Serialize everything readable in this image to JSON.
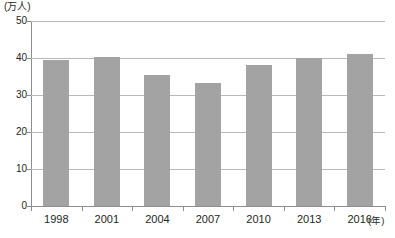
{
  "chart_data": {
    "type": "bar",
    "title": "",
    "subtitle": "",
    "xlabel": "(年)",
    "ylabel": "(万人)",
    "categories": [
      "1998",
      "2001",
      "2004",
      "2007",
      "2010",
      "2013",
      "2016"
    ],
    "values": [
      39.5,
      40.3,
      35.3,
      33.3,
      38.0,
      40.0,
      41.0
    ],
    "series": [
      {
        "name": "人数",
        "values": [
          39.5,
          40.3,
          35.3,
          33.3,
          38.0,
          40.0,
          41.0
        ]
      }
    ],
    "ylim": [
      0,
      50
    ],
    "ytick_labels": [
      "0",
      "10",
      "20",
      "30",
      "40",
      "50"
    ],
    "ytick_values": [
      0,
      10,
      20,
      30,
      40,
      50
    ],
    "xtick_labels": [
      "1998",
      "2001",
      "2004",
      "2007",
      "2010",
      "2013",
      "2016"
    ],
    "grid": true,
    "grid_axis": "y",
    "legend": false,
    "legend_position": "none",
    "bar_color": "#a3a3a3",
    "gridline_color": "#b9b9b9",
    "axis_color": "#8d8d8d",
    "background_color": "#ffffff",
    "annotations": []
  },
  "axes": {
    "y_unit": "(万人)",
    "x_unit": "(年)"
  }
}
